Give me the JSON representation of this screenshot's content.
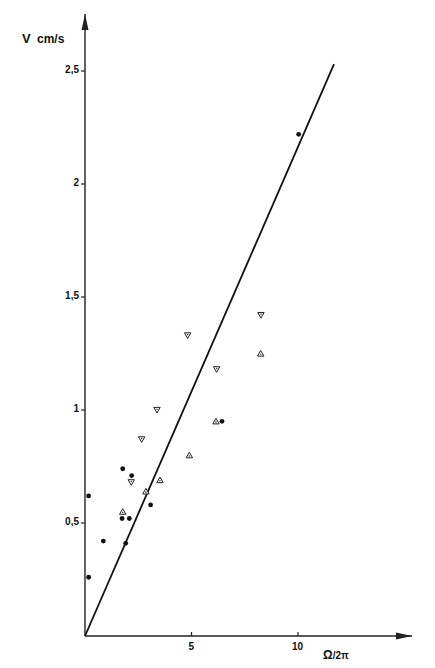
{
  "chart_data": {
    "type": "scatter",
    "title": "",
    "xlabel": "Ω/2π",
    "ylabel": "V cm/s",
    "xlim": [
      0,
      12
    ],
    "ylim": [
      0,
      2.6
    ],
    "grid": false,
    "legend": null,
    "x_ticks": [
      {
        "value": 5,
        "label": "5"
      },
      {
        "value": 10,
        "label": "10"
      }
    ],
    "y_ticks": [
      {
        "value": 0.5,
        "label": "0,5"
      },
      {
        "value": 1,
        "label": "1"
      },
      {
        "value": 1.5,
        "label": "1,5"
      },
      {
        "value": 2,
        "label": "2"
      },
      {
        "value": 2.5,
        "label": "2,5"
      }
    ],
    "series": [
      {
        "name": "dots",
        "marker": "filled-circle",
        "points": [
          [
            0.17,
            0.62
          ],
          [
            0.17,
            0.26
          ],
          [
            0.86,
            0.42
          ],
          [
            1.77,
            0.74
          ],
          [
            2.19,
            0.71
          ],
          [
            3.08,
            0.58
          ],
          [
            1.74,
            0.52
          ],
          [
            2.08,
            0.52
          ],
          [
            1.91,
            0.41
          ],
          [
            6.43,
            0.95
          ],
          [
            10.03,
            2.22
          ]
        ]
      },
      {
        "name": "triangles-down",
        "marker": "triangle-down",
        "points": [
          [
            2.17,
            0.68
          ],
          [
            2.66,
            0.87
          ],
          [
            3.38,
            1.0
          ],
          [
            6.18,
            1.18
          ],
          [
            4.82,
            1.33
          ],
          [
            8.26,
            1.42
          ]
        ]
      },
      {
        "name": "triangles-up",
        "marker": "triangle-up",
        "points": [
          [
            1.77,
            0.55
          ],
          [
            2.86,
            0.64
          ],
          [
            3.52,
            0.69
          ],
          [
            4.9,
            0.8
          ],
          [
            6.15,
            0.95
          ],
          [
            8.25,
            1.25
          ]
        ]
      }
    ],
    "fit_line": {
      "from": [
        0,
        0
      ],
      "to": [
        11.69,
        2.53
      ]
    }
  },
  "axes": {
    "x_label_main": "Ω",
    "x_label_sub": "/2π",
    "y_label_v": "V",
    "y_label_unit": "cm/s"
  }
}
